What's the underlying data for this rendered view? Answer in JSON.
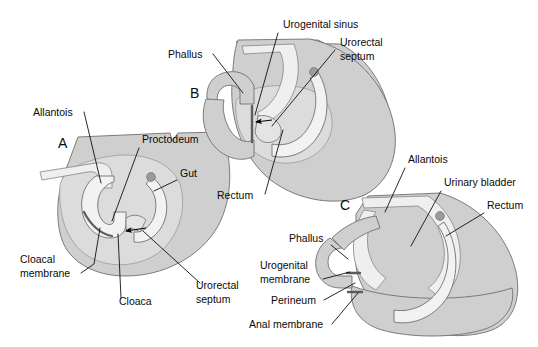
{
  "figure": {
    "background": "#ffffff",
    "width": 538,
    "height": 347,
    "colors": {
      "mesenchyme_fill": "#cfcfcf",
      "mesenchyme_fill_light": "#dcdcdc",
      "lumen_fill": "#efefef",
      "lumen_fill_pale": "#f5f5f5",
      "outline": "#6f6f6f",
      "leader_line": "#111111",
      "text": "#0a0a0a",
      "node_dot": "#8a8a8a",
      "arrow": "#000000"
    }
  },
  "panels": [
    {
      "id": "A",
      "letter": "A",
      "letter_pos": {
        "x": 58,
        "y": 148
      },
      "labels": [
        {
          "key": "allantois",
          "text": "Allantois",
          "x": 33,
          "y": 116,
          "anchor": "start"
        },
        {
          "key": "proctodeum",
          "text": "Proctodeum",
          "x": 142,
          "y": 143,
          "anchor": "start"
        },
        {
          "key": "gut",
          "text": "Gut",
          "x": 180,
          "y": 177,
          "anchor": "start"
        },
        {
          "key": "cloacal-membrane",
          "text": "Cloacal",
          "x": 20,
          "y": 263,
          "anchor": "start"
        },
        {
          "key": "cloacal-membrane2",
          "text": "membrane",
          "x": 20,
          "y": 277,
          "anchor": "start"
        },
        {
          "key": "cloaca",
          "text": "Cloaca",
          "x": 119,
          "y": 305,
          "anchor": "start"
        },
        {
          "key": "urorectal-septum",
          "text": "Urorectal",
          "x": 196,
          "y": 289,
          "anchor": "start"
        },
        {
          "key": "urorectal-septum2",
          "text": "septum",
          "x": 196,
          "y": 303,
          "anchor": "start"
        }
      ]
    },
    {
      "id": "B",
      "letter": "B",
      "letter_pos": {
        "x": 190,
        "y": 98
      },
      "labels": [
        {
          "key": "urogenital-sinus",
          "text": "Urogenital sinus",
          "x": 283,
          "y": 28,
          "anchor": "start"
        },
        {
          "key": "urorectal-septum",
          "text": "Urorectal",
          "x": 340,
          "y": 46,
          "anchor": "start"
        },
        {
          "key": "urorectal-septum2",
          "text": "septum",
          "x": 340,
          "y": 60,
          "anchor": "start"
        },
        {
          "key": "phallus",
          "text": "Phallus",
          "x": 168,
          "y": 58,
          "anchor": "start"
        },
        {
          "key": "rectum",
          "text": "Rectum",
          "x": 217,
          "y": 199,
          "anchor": "start"
        }
      ]
    },
    {
      "id": "C",
      "letter": "C",
      "letter_pos": {
        "x": 340,
        "y": 210
      },
      "labels": [
        {
          "key": "allantois",
          "text": "Allantois",
          "x": 408,
          "y": 163,
          "anchor": "start"
        },
        {
          "key": "urinary-bladder",
          "text": "Urinary bladder",
          "x": 444,
          "y": 186,
          "anchor": "start"
        },
        {
          "key": "rectum",
          "text": "Rectum",
          "x": 487,
          "y": 209,
          "anchor": "start"
        },
        {
          "key": "phallus",
          "text": "Phallus",
          "x": 289,
          "y": 242,
          "anchor": "start"
        },
        {
          "key": "urogenital-membrane",
          "text": "Urogenital",
          "x": 260,
          "y": 269,
          "anchor": "start"
        },
        {
          "key": "urogenital-membrane2",
          "text": "membrane",
          "x": 260,
          "y": 283,
          "anchor": "start"
        },
        {
          "key": "perineum",
          "text": "Perineum",
          "x": 271,
          "y": 304,
          "anchor": "start"
        },
        {
          "key": "anal-membrane",
          "text": "Anal membrane",
          "x": 249,
          "y": 328,
          "anchor": "start"
        }
      ]
    }
  ],
  "structures": {
    "A": [
      "allantois",
      "proctodeum",
      "gut",
      "cloacal membrane",
      "cloaca",
      "urorectal septum"
    ],
    "B": [
      "urogenital sinus",
      "urorectal septum",
      "phallus",
      "rectum"
    ],
    "C": [
      "allantois",
      "urinary bladder",
      "rectum",
      "phallus",
      "urogenital membrane",
      "perineum",
      "anal membrane"
    ]
  }
}
